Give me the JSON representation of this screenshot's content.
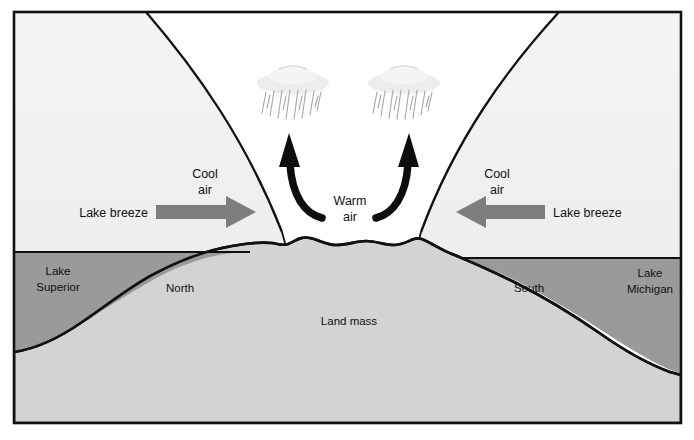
{
  "diagram": {
    "labels": {
      "cool_air_left": {
        "line1": "Cool",
        "line2": "air"
      },
      "cool_air_right": {
        "line1": "Cool",
        "line2": "air"
      },
      "warm_air": {
        "line1": "Warm",
        "line2": "air"
      },
      "lake_breeze_left": "Lake breeze",
      "lake_breeze_right": "Lake breeze",
      "lake_superior": {
        "line1": "Lake",
        "line2": "Superior"
      },
      "lake_michigan": {
        "line1": "Lake",
        "line2": "Michigan"
      },
      "north": "North",
      "south": "South",
      "land_mass": "Land mass"
    },
    "icons": {
      "rain_cloud_left": "rain-cloud-icon",
      "rain_cloud_right": "rain-cloud-icon",
      "updraft_arrow_left": "curved-up-arrow-icon",
      "updraft_arrow_right": "curved-up-arrow-icon",
      "breeze_arrow_left": "block-arrow-right-icon",
      "breeze_arrow_right": "block-arrow-left-icon"
    },
    "colors": {
      "frame": "#111111",
      "background": "#ffffff",
      "cool_air_fill": "#f1f1f1",
      "convergence_fill": "#ffffff",
      "land_fill": "#d3d3d3",
      "water_fill": "#9a9a9a",
      "arrow_gray": "#7d7d7d",
      "updraft_black": "#0d0d0d",
      "rain_gray": "#c9c9c9"
    }
  }
}
